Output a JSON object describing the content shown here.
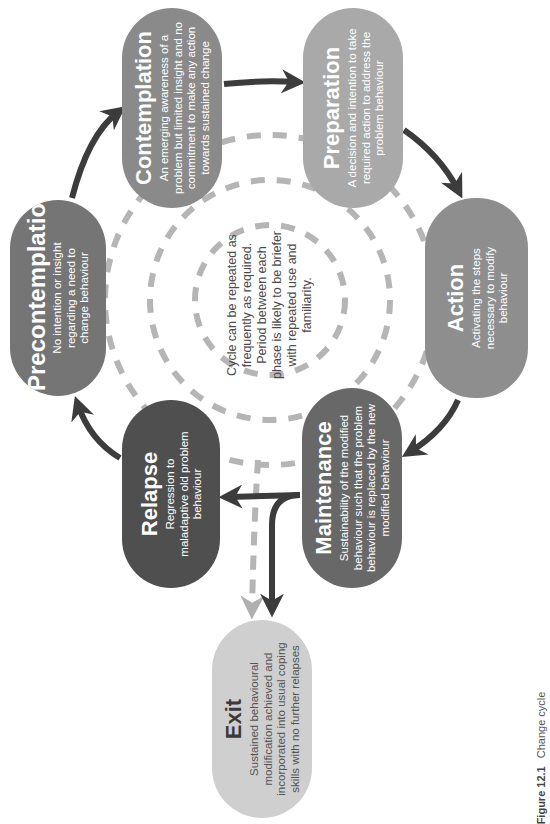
{
  "stages": {
    "precontemplation": {
      "title": "Precontemplation",
      "description": "No intention or insight regarding a need to change behaviour",
      "color": "#757575"
    },
    "contemplation": {
      "title": "Contemplation",
      "description": "An emerging awareness of a problem but limited insight and no commitment to make any action towards sustained change",
      "color": "#8a8a8a"
    },
    "preparation": {
      "title": "Preparation",
      "description": "A decision and intention to take required action to address the problem behaviour",
      "color": "#a9a9a9"
    },
    "action": {
      "title": "Action",
      "description": "Activating the steps necessary to modify behaviour",
      "color": "#8e8e8e"
    },
    "maintenance": {
      "title": "Maintenance",
      "description": "Sustainability of the modified behaviour such that the problem behaviour is replaced by the new modified behaviour",
      "color": "#686868"
    },
    "relapse": {
      "title": "Relapse",
      "description": "Regression to maladaptive old problem behaviour",
      "color": "#4f4f4f"
    },
    "exit": {
      "title": "Exit",
      "description": "Sustained behavioural modification achieved and incorporated into usual coping skills with no further relapses",
      "color": "#cfcfcf"
    }
  },
  "center_note": "Cycle can be repeated as frequently as required. Period between each phase is likely to be briefer with repeated use and familiarity.",
  "caption": {
    "figure_label": "Figure 12.1",
    "text": "Change cycle"
  },
  "colors": {
    "arrow": "#3c3c3c",
    "dashed": "#b5b5b5",
    "dashed_arrow_head": "#b0b0b0"
  },
  "orientation": "rotated 90deg counter-clockwise"
}
